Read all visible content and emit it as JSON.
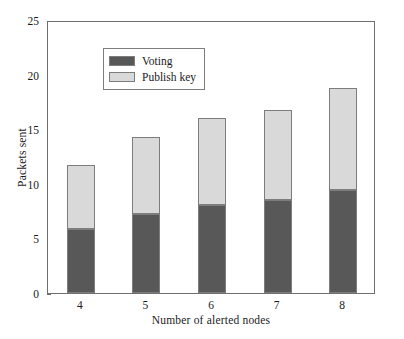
{
  "chart_data": {
    "type": "bar",
    "subtype": "stacked-vertical",
    "title": "",
    "xlabel": "Number of alerted nodes",
    "ylabel": "Packets sent",
    "categories": [
      "4",
      "5",
      "6",
      "7",
      "8"
    ],
    "series": [
      {
        "name": "Voting",
        "color": "#585858",
        "values": [
          5.9,
          7.2,
          8.1,
          8.5,
          9.4
        ]
      },
      {
        "name": "Publish key",
        "color": "#d9d9d9",
        "values": [
          5.8,
          7.1,
          7.9,
          8.3,
          9.4
        ]
      }
    ],
    "totals": [
      11.7,
      14.3,
      16.0,
      16.8,
      18.8
    ],
    "ylim": [
      0,
      25
    ],
    "yticks": [
      0,
      5,
      10,
      15,
      20,
      25
    ],
    "ytick_labels": [
      "0",
      "5",
      "10",
      "15",
      "20",
      "25"
    ],
    "xtick_labels": [
      "4",
      "5",
      "6",
      "7",
      "8"
    ],
    "grid": false,
    "legend_position": "upper-left",
    "legend_entries": [
      "Voting",
      "Publish key"
    ],
    "axis_color": "#6f6f6f",
    "background": "#ffffff"
  }
}
